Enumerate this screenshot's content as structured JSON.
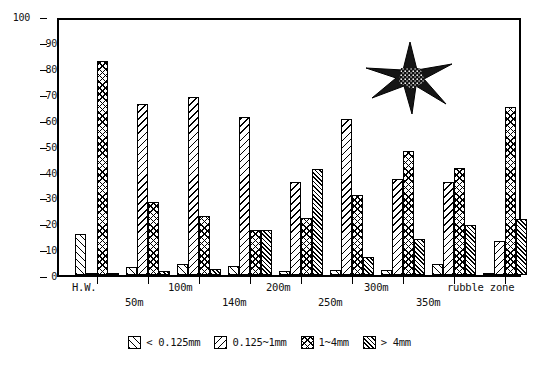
{
  "chart_data": {
    "type": "bar",
    "title": "",
    "subtitle": "",
    "xlabel": "",
    "ylabel": "",
    "ylim": [
      0,
      100
    ],
    "ytick_values": [
      0,
      10,
      20,
      30,
      40,
      50,
      60,
      70,
      80,
      90,
      100
    ],
    "ytick_labels": [
      "0",
      "10",
      "20",
      "30",
      "40",
      "50",
      "60",
      "70",
      "80",
      "90",
      "100"
    ],
    "grid": false,
    "legend_position": "bottom",
    "categories": [
      "H.W.",
      "50m",
      "100m",
      "140m",
      "200m",
      "250m",
      "300m",
      "350m",
      "rubble zone"
    ],
    "series": [
      {
        "name": "< 0.125mm",
        "pattern": "forward-hatch",
        "values": [
          16,
          3,
          4.5,
          3.5,
          1.5,
          2,
          2,
          4.5,
          0.5
        ]
      },
      {
        "name": "0.125~1mm",
        "pattern": "back-hatch",
        "values": [
          0.5,
          67,
          70,
          62,
          36.5,
          61,
          37.5,
          36.5,
          13.5
        ]
      },
      {
        "name": "1~4mm",
        "pattern": "cross-hatch",
        "values": [
          84,
          28.5,
          23,
          17.5,
          22.5,
          31.5,
          48.5,
          42,
          66
        ]
      },
      {
        "name": "> 4mm",
        "pattern": "dense-forward-hatch",
        "values": [
          0.5,
          1.5,
          2.5,
          17.5,
          41.5,
          7,
          14,
          19.5,
          22
        ]
      }
    ],
    "annotations": [
      {
        "name": "starfish-illustration",
        "description": "stippled six-armed sea star drawing",
        "x": 0.69,
        "y": 0.78
      }
    ]
  },
  "legend": {
    "items": [
      {
        "label": "< 0.125mm",
        "swatch": "forward-hatch-swatch"
      },
      {
        "label": "0.125~1mm",
        "swatch": "back-hatch-swatch"
      },
      {
        "label": "1~4mm",
        "swatch": "cross-hatch-swatch"
      },
      {
        "label": "> 4mm",
        "swatch": "dense-forward-hatch-swatch"
      }
    ]
  },
  "colors": {
    "ink": "#000000",
    "background": "#ffffff"
  }
}
